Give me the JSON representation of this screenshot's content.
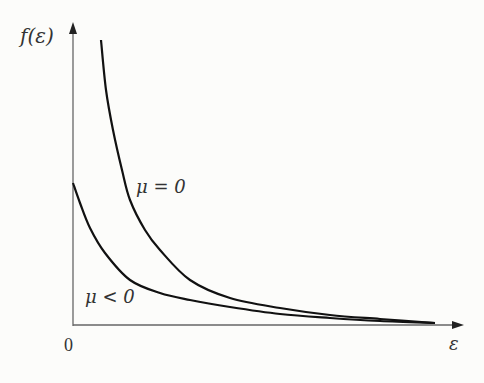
{
  "chart_data": {
    "type": "line",
    "title": "",
    "xlabel": "ε",
    "ylabel": "f(ε)",
    "x_tick_labels": [
      "0"
    ],
    "grid": false,
    "legend": "inline annotations",
    "series": [
      {
        "name": "μ = 0",
        "description": "diverges as ε → 0, decays toward zero",
        "points_px": [
          [
            101,
            40
          ],
          [
            106,
            90
          ],
          [
            113,
            130
          ],
          [
            122,
            170
          ],
          [
            130,
            200
          ],
          [
            145,
            230
          ],
          [
            160,
            250
          ],
          [
            190,
            280
          ],
          [
            230,
            298
          ],
          [
            280,
            308
          ],
          [
            330,
            315
          ],
          [
            380,
            319
          ],
          [
            435,
            323
          ]
        ]
      },
      {
        "name": "μ < 0",
        "description": "finite at ε = 0, decays toward zero",
        "points_px": [
          [
            73,
            183
          ],
          [
            80,
            203
          ],
          [
            90,
            228
          ],
          [
            105,
            253
          ],
          [
            130,
            280
          ],
          [
            160,
            293
          ],
          [
            190,
            300
          ],
          [
            230,
            307
          ],
          [
            280,
            314
          ],
          [
            330,
            318
          ],
          [
            380,
            321
          ],
          [
            435,
            323
          ]
        ]
      }
    ],
    "annotations": [
      {
        "text": "μ = 0",
        "x_px": 138,
        "y_px": 192
      },
      {
        "text": "μ < 0",
        "x_px": 86,
        "y_px": 302
      }
    ]
  },
  "labels": {
    "y_axis": "f(ε)",
    "x_axis": "ε",
    "origin": "0",
    "mu_zero": "μ = 0",
    "mu_neg": "μ < 0"
  }
}
